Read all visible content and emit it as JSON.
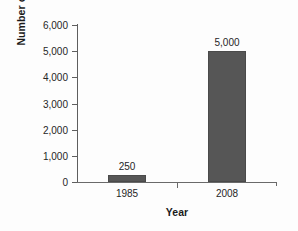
{
  "chart_data": {
    "type": "bar",
    "title": "",
    "xlabel": "Year",
    "ylabel": "Number of Courses",
    "categories": [
      "1985",
      "2008"
    ],
    "values": [
      250,
      5000
    ],
    "value_labels": [
      "250",
      "5,000"
    ],
    "ylim": [
      0,
      6000
    ],
    "yticks": [
      0,
      1000,
      2000,
      3000,
      4000,
      5000,
      6000
    ],
    "ytick_labels": [
      "0",
      "1,000",
      "2,000",
      "3,000",
      "4,000",
      "5,000",
      "6,000"
    ],
    "grid": false,
    "legend": "none",
    "series": [
      {
        "name": "Number of Courses",
        "values": [
          250,
          5000
        ],
        "color": "#565656"
      }
    ],
    "colors": {
      "bar_fill": "#565656",
      "bar_border": "#4a4a4a",
      "axis": "#5e5e5e",
      "text": "#262626",
      "background": "#fdfdfd"
    }
  }
}
